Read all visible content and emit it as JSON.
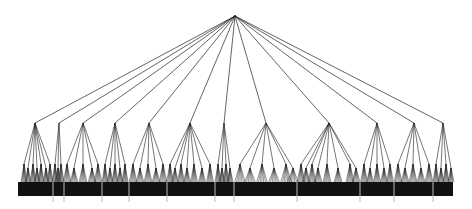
{
  "diagram": {
    "type": "hierarchical-tree",
    "colors": {
      "edge": "#222222",
      "leaf_band": "#111111",
      "separator": "#bdbdbd",
      "background": "#ffffff"
    },
    "root": {
      "x": 235,
      "y": 16
    },
    "level2_y": 123,
    "level3_y": 166,
    "leaf_y": 182,
    "band": {
      "x": 18,
      "y": 182,
      "width": 435,
      "height": 14
    },
    "separator_bottom": 202,
    "subtrees": [
      {
        "x": 35,
        "children": [
          24,
          28,
          33,
          37,
          41,
          46,
          50
        ],
        "range": [
          18,
          53
        ]
      },
      {
        "x": 59,
        "children": [
          55,
          58,
          61
        ],
        "range": [
          53,
          64
        ]
      },
      {
        "x": 83,
        "children": [
          67,
          74,
          83,
          92,
          98
        ],
        "range": [
          64,
          102
        ]
      },
      {
        "x": 115,
        "children": [
          105,
          110,
          115,
          120,
          125
        ],
        "range": [
          102,
          129
        ]
      },
      {
        "x": 149,
        "children": [
          133,
          140,
          148,
          156,
          163
        ],
        "range": [
          129,
          167
        ]
      },
      {
        "x": 190,
        "children": [
          170,
          175,
          181,
          187,
          194,
          202,
          210
        ],
        "range": [
          167,
          215
        ]
      },
      {
        "x": 224,
        "children": [
          218,
          222,
          226,
          230
        ],
        "range": [
          215,
          234
        ]
      },
      {
        "x": 266,
        "children": [
          240,
          250,
          262,
          274,
          286,
          293
        ],
        "range": [
          234,
          297
        ]
      },
      {
        "x": 329,
        "children": [
          301,
          306,
          312,
          318,
          327,
          338,
          350,
          356
        ],
        "range": [
          297,
          360
        ]
      },
      {
        "x": 377,
        "children": [
          364,
          370,
          377,
          384,
          390
        ],
        "range": [
          360,
          394
        ]
      },
      {
        "x": 414,
        "children": [
          398,
          405,
          413,
          421,
          429
        ],
        "range": [
          394,
          433
        ]
      },
      {
        "x": 443,
        "children": [
          436,
          441,
          446,
          451
        ],
        "range": [
          433,
          453
        ]
      }
    ],
    "separators": [
      53,
      64,
      102,
      129,
      167,
      215,
      234,
      297,
      360,
      394,
      433
    ]
  }
}
